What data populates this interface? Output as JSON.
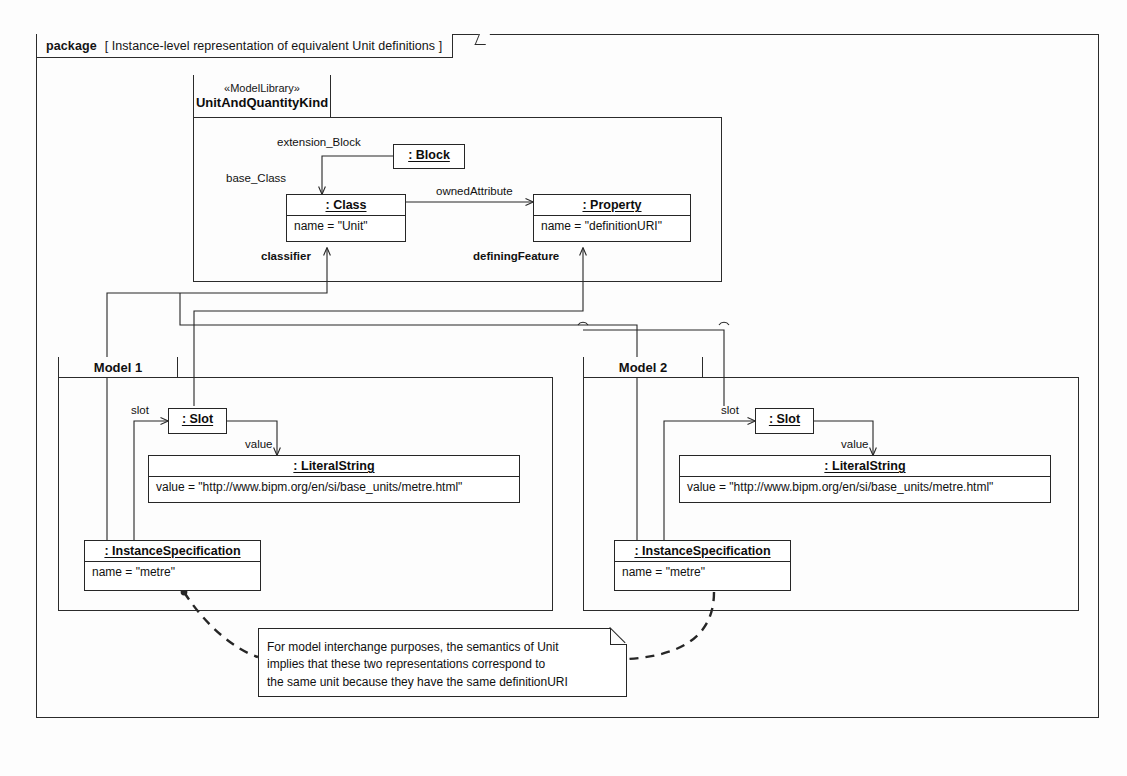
{
  "diagram": {
    "kind": "uml-package-instance-diagram",
    "package": {
      "keyword": "package",
      "name_bracketed": "[ Instance-level representation of equivalent Unit definitions ]"
    },
    "model_library": {
      "stereotype": "«ModelLibrary»",
      "name": "UnitAndQuantityKind"
    },
    "frames": [
      {
        "label": "Model 1"
      },
      {
        "label": "Model 2"
      }
    ],
    "nodes": {
      "block": {
        "header": ": Block"
      },
      "class": {
        "header": ": Class",
        "attribute": "name = \"Unit\""
      },
      "property": {
        "header": ": Property",
        "attribute": "name = \"definitionURI\""
      },
      "m1_slot": {
        "header": ": Slot"
      },
      "m1_literal": {
        "header": ": LiteralString",
        "attribute": "value = \"http://www.bipm.org/en/si/base_units/metre.html\""
      },
      "m1_instance": {
        "header": ": InstanceSpecification",
        "attribute": "name = \"metre\""
      },
      "m2_slot": {
        "header": ": Slot"
      },
      "m2_literal": {
        "header": ": LiteralString",
        "attribute": "value = \"http://www.bipm.org/en/si/base_units/metre.html\""
      },
      "m2_instance": {
        "header": ": InstanceSpecification",
        "attribute": "name = \"metre\""
      }
    },
    "edge_labels": {
      "extension_block": "extension_Block",
      "base_class": "base_Class",
      "owned_attribute": "ownedAttribute",
      "classifier": "classifier",
      "defining_feature": "definingFeature",
      "m1_slot": "slot",
      "m1_value": "value",
      "m2_slot": "slot",
      "m2_value": "value"
    },
    "note": {
      "lines": [
        "For model interchange purposes, the semantics of Unit",
        "implies that these two representations correspond to",
        "the same unit because they have the same definitionURI"
      ]
    },
    "colors": {
      "line": "#262626",
      "background": "#fdfdfd",
      "node_fill": "#ffffff",
      "text": "#111111"
    }
  }
}
